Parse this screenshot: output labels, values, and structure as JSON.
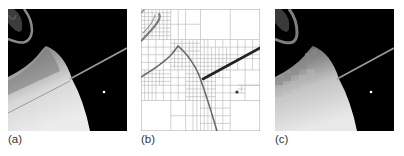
{
  "figure": {
    "panels": [
      {
        "id": "a",
        "label": "(a)",
        "content": "original-image"
      },
      {
        "id": "b",
        "label": "(b)",
        "content": "quadtree-decomposition"
      },
      {
        "id": "c",
        "label": "(c)",
        "content": "reconstructed-image"
      }
    ],
    "colors": {
      "background": "#000000",
      "planet_light": "#e6e6e6",
      "planet_mid": "#9a9a9a",
      "grid_line": "#b0b0b0",
      "edge_dark": "#3a3a3a"
    }
  }
}
